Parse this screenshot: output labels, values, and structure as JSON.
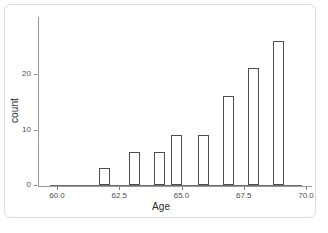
{
  "chart_data": {
    "type": "bar",
    "title": "",
    "subtitle": "",
    "xlabel": "Age",
    "ylabel": "count",
    "x": [
      61.9,
      63.1,
      64.1,
      64.8,
      65.9,
      66.9,
      67.9,
      68.9
    ],
    "values": [
      3,
      6,
      6,
      9,
      9,
      16,
      21,
      26
    ],
    "xlim": [
      60.0,
      70.0
    ],
    "ylim": [
      0,
      27
    ],
    "xticks": [
      60.0,
      62.5,
      65.0,
      67.5,
      70.0
    ],
    "xtick_labels": [
      "60.0",
      "62.5",
      "65.0",
      "67.5",
      "70.0"
    ],
    "yticks": [
      0,
      10,
      20
    ],
    "ytick_labels": [
      "0",
      "10",
      "20"
    ],
    "grid": false,
    "legend": false,
    "bar_fill": "#ffffff",
    "bar_stroke": "#4f4f4f",
    "axis_color": "#9a9a9a",
    "background": "#ffffff",
    "bars": [
      {
        "label": "61.9",
        "value": 3,
        "center_pct": 23.8
      },
      {
        "label": "63.1",
        "value": 6,
        "center_pct": 36.0
      },
      {
        "label": "64.1",
        "value": 6,
        "center_pct": 46.0
      },
      {
        "label": "64.8",
        "value": 9,
        "center_pct": 53.0
      },
      {
        "label": "65.9",
        "value": 9,
        "center_pct": 63.0
      },
      {
        "label": "66.9",
        "value": 16,
        "center_pct": 75.5
      },
      {
        "label": "67.9",
        "value": 21,
        "center_pct": 84.5
      },
      {
        "label": "68.9",
        "value": 26,
        "center_pct": 95.2
      }
    ]
  },
  "card": {
    "border_color": "#d9d9d9"
  }
}
